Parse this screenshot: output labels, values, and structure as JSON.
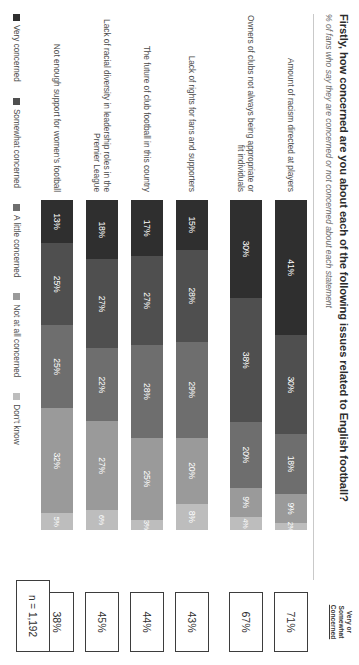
{
  "header": {
    "title": "Firstly, how concerned are you about each of the following issues related to English football?",
    "subtitle": "% of fans who say they are concerned or not concerned about each statement",
    "right_column_heading_line1": "Very or",
    "right_column_heading_line2": "Somewhat",
    "right_column_heading_line3": "Concerned"
  },
  "footer": {
    "sample_size": "n = 1,192"
  },
  "chart_data": {
    "type": "bar",
    "orientation": "horizontal",
    "stacked": true,
    "stack_total": 100,
    "title": "Firstly, how concerned are you about each of the following issues related to English football?",
    "subtitle": "% of fans who say they are concerned or not concerned about each statement",
    "xlabel": "",
    "ylabel": "",
    "xlim": [
      0,
      100
    ],
    "grid": false,
    "legend_position": "bottom-left",
    "categories": [
      "Amount of racism directed at players",
      "Owners of clubs not always being appropriate or fit individuals",
      "Lack of rights for fans and supporters",
      "The future of club football in this country",
      "Lack of racial diversity in leadership roles in the Premier League",
      "Not enough support for women's football"
    ],
    "series": [
      {
        "name": "Very concerned",
        "color": "#2f2f2f",
        "values": [
          41,
          30,
          15,
          17,
          18,
          13
        ]
      },
      {
        "name": "Somewhat concerned",
        "color": "#4f4f4f",
        "values": [
          30,
          38,
          28,
          27,
          27,
          25
        ]
      },
      {
        "name": "A little concerned",
        "color": "#6e6e6e",
        "values": [
          18,
          20,
          29,
          28,
          22,
          25
        ]
      },
      {
        "name": "Not at all concerned",
        "color": "#9a9a9a",
        "values": [
          9,
          9,
          20,
          25,
          27,
          32
        ]
      },
      {
        "name": "Don't know",
        "color": "#bdbdbd",
        "values": [
          2,
          4,
          8,
          3,
          6,
          5
        ]
      }
    ],
    "value_labels": [
      [
        "41%",
        "30%",
        "18%",
        "9%",
        "2%"
      ],
      [
        "30%",
        "38%",
        "20%",
        "9%",
        "4%"
      ],
      [
        "15%",
        "28%",
        "29%",
        "20%",
        "8%"
      ],
      [
        "17%",
        "27%",
        "28%",
        "25%",
        "3%"
      ],
      [
        "18%",
        "27%",
        "22%",
        "27%",
        "6%"
      ],
      [
        "13%",
        "25%",
        "25%",
        "32%",
        "5%"
      ]
    ],
    "very_or_somewhat_concerned": [
      "71%",
      "67%",
      "43%",
      "44%",
      "45%",
      "38%"
    ],
    "group_break_after_row": 2,
    "sample_size": "n = 1,192"
  },
  "legend": [
    {
      "label": "Very concerned",
      "color": "#2f2f2f"
    },
    {
      "label": "Somewhat concerned",
      "color": "#4f4f4f"
    },
    {
      "label": "A little concerned",
      "color": "#6e6e6e"
    },
    {
      "label": "Not at all concerned",
      "color": "#9a9a9a"
    },
    {
      "label": "Don't know",
      "color": "#bdbdbd"
    }
  ]
}
